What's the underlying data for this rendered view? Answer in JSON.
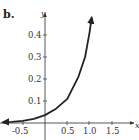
{
  "panel": {
    "label": "b."
  },
  "chart_data": {
    "type": "line",
    "title": "",
    "xlabel": "x",
    "ylabel": "y",
    "xlim": [
      -0.95,
      2.0
    ],
    "ylim": [
      -0.07,
      0.5
    ],
    "grid": false,
    "x_ticks": [
      "-0.5",
      "0.5",
      "1.0",
      "1.5"
    ],
    "y_ticks": [
      "0.1",
      "0.2",
      "0.3",
      "0.4"
    ],
    "series": [
      {
        "name": "curve",
        "x": [
          -0.95,
          -0.75,
          -0.5,
          -0.25,
          0,
          0.25,
          0.5,
          0.75,
          0.9,
          1.0,
          1.05
        ],
        "y": [
          0.003,
          0.005,
          0.01,
          0.019,
          0.036,
          0.065,
          0.11,
          0.21,
          0.3,
          0.41,
          0.48
        ]
      }
    ],
    "annotations": [
      "arrowheads at both ends of curve and at positive ends of axes"
    ]
  },
  "colors": {
    "ink": "#222222",
    "axis": "#444444"
  }
}
